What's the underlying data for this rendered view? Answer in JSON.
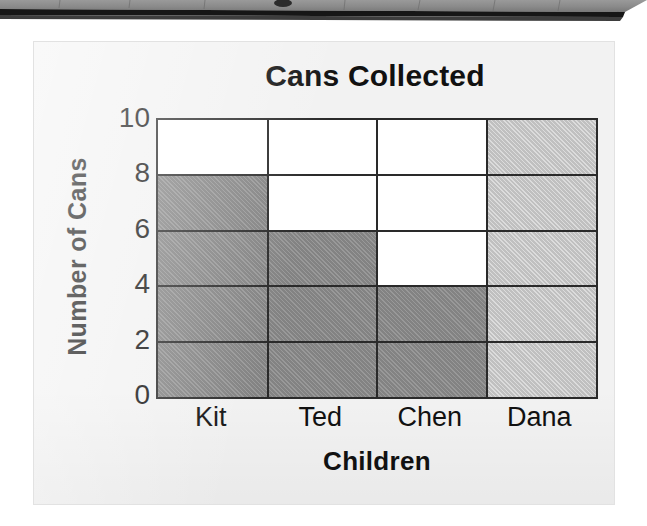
{
  "page": {
    "background_color": "#ffffff",
    "card_background_color": "#f2f2f2"
  },
  "scan_artifact": {
    "name": "slanted-page-edge",
    "top_color": "#8f8f8f",
    "edge_color": "#1a1a1a"
  },
  "chart_data": {
    "type": "bar",
    "title": "Cans Collected",
    "xlabel": "Children",
    "ylabel": "Number of Cans",
    "categories": [
      "Kit",
      "Ted",
      "Chen",
      "Dana"
    ],
    "values": [
      8,
      6,
      4,
      10
    ],
    "ylim": [
      0,
      10
    ],
    "yticks": [
      0,
      2,
      4,
      6,
      8,
      10
    ],
    "ytick_labels": [
      "0",
      "2",
      "4",
      "6",
      "8",
      "10"
    ],
    "grid": true,
    "grid_orientation": "both",
    "legend": false,
    "bar_colors": [
      "#8b8b8b",
      "#8b8b8b",
      "#8b8b8b",
      "#cacaca"
    ],
    "bar_edge_color": "#2a2a2a",
    "plot_background_color": "#ffffff",
    "bars": [
      {
        "category": "Kit",
        "value": 8,
        "fill": "dark",
        "color": "#8b8b8b"
      },
      {
        "category": "Ted",
        "value": 6,
        "fill": "dark",
        "color": "#8b8b8b"
      },
      {
        "category": "Chen",
        "value": 4,
        "fill": "dark",
        "color": "#8b8b8b"
      },
      {
        "category": "Dana",
        "value": 10,
        "fill": "light",
        "color": "#cacaca"
      }
    ]
  }
}
